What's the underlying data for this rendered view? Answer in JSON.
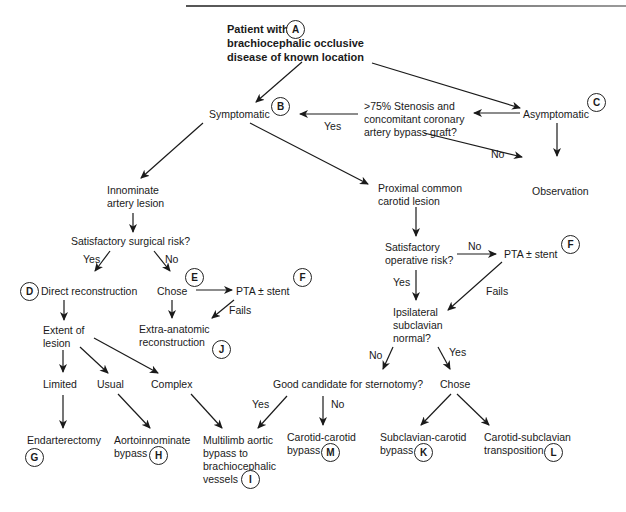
{
  "nodes": {
    "start": "Patient with\nbrachiocephalic occlusive\ndisease of known location",
    "symptomatic": "Symptomatic",
    "asymptomatic": "Asymptomatic",
    "stenosis_q": ">75% Stenosis and\nconcomitant coronary\nartery bypass graft?",
    "observation": "Observation",
    "innominate": "Innominate\nartery lesion",
    "proximal_carotid": "Proximal common\ncarotid lesion",
    "surgical_risk_q": "Satisfactory surgical risk?",
    "direct_reconstruction": "Direct reconstruction",
    "chose_left": "Chose",
    "pta_left": "PTA ± stent",
    "extent": "Extent of\nlesion",
    "extra_anatomic": "Extra-anatomic\nreconstruction",
    "limited": "Limited",
    "usual": "Usual",
    "complex": "Complex",
    "endarterectomy": "Endarterectomy",
    "aortoinnominate": "Aortoinnominate\nbypass",
    "multilimb": "Multilimb aortic\nbypass to\nbrachiocephalic\nvessels",
    "operative_risk_q": "Satisfactory\noperative risk?",
    "pta_right": "PTA ± stent",
    "ipsilateral_q": "Ipsilateral\nsubclavian\nnormal?",
    "sternotomy_q": "Good candidate for sternotomy?",
    "chose_right": "Chose",
    "carotid_carotid": "Carotid-carotid\nbypass",
    "subclavian_carotid": "Subclavian-carotid\nbypass",
    "carotid_subclavian": "Carotid-subclavian\ntransposition"
  },
  "badges": {
    "A": "A",
    "B": "B",
    "C": "C",
    "D": "D",
    "E": "E",
    "F1": "F",
    "F2": "F",
    "G": "G",
    "H": "H",
    "I": "I",
    "J": "J",
    "K": "K",
    "L": "L",
    "M": "M"
  },
  "edge_labels": {
    "yes_stenosis": "Yes",
    "no_stenosis": "No",
    "yes_surgical": "Yes",
    "no_surgical": "No",
    "fails_left": "Fails",
    "no_operative": "No",
    "yes_operative": "Yes",
    "fails_right": "Fails",
    "no_ipsilateral": "No",
    "yes_ipsilateral": "Yes",
    "yes_sternotomy": "Yes",
    "no_sternotomy": "No"
  }
}
